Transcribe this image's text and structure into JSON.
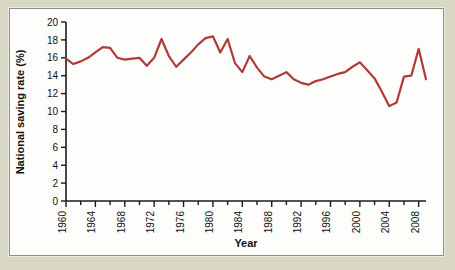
{
  "figure": {
    "background_color": "#d9d8c4",
    "card_color": "#fdfdfb",
    "border_color": "#8e8e86",
    "line_color": "#b03a3a",
    "axis_color": "#1a1a1a"
  },
  "chart_data": {
    "type": "line",
    "title": "",
    "xlabel": "Year",
    "ylabel": "National saving rate (%)",
    "xlim": [
      1960,
      2009
    ],
    "ylim": [
      0,
      20
    ],
    "grid": false,
    "legend": "none",
    "x_tick_labels": [
      "1960",
      "1964",
      "1968",
      "1972",
      "1976",
      "1980",
      "1984",
      "1988",
      "1992",
      "1996",
      "2000",
      "2004",
      "2008"
    ],
    "x_tick_step": 4,
    "x_minor_tick_step": 2,
    "y_tick_labels": [
      "0",
      "2",
      "4",
      "6",
      "8",
      "10",
      "12",
      "14",
      "16",
      "18",
      "20"
    ],
    "y_tick_step": 2,
    "series": [
      {
        "name": "National saving rate",
        "color": "#b03a3a",
        "x": [
          1960,
          1961,
          1962,
          1963,
          1964,
          1965,
          1966,
          1967,
          1968,
          1969,
          1970,
          1971,
          1972,
          1973,
          1974,
          1975,
          1976,
          1977,
          1978,
          1979,
          1980,
          1981,
          1982,
          1983,
          1984,
          1985,
          1986,
          1987,
          1988,
          1989,
          1990,
          1991,
          1992,
          1993,
          1994,
          1995,
          1996,
          1997,
          1998,
          1999,
          2000,
          2001,
          2002,
          2003,
          2004,
          2005,
          2006,
          2007,
          2008,
          2009
        ],
        "values": [
          15.9,
          15.3,
          15.6,
          16.0,
          16.6,
          17.2,
          17.1,
          16.0,
          15.8,
          15.9,
          16.0,
          15.1,
          16.0,
          18.1,
          16.2,
          15.0,
          15.8,
          16.6,
          17.5,
          18.2,
          18.4,
          16.6,
          18.1,
          15.4,
          14.4,
          16.2,
          14.9,
          13.9,
          13.6,
          14.0,
          14.4,
          13.6,
          13.2,
          13.0,
          13.4,
          13.6,
          13.9,
          14.2,
          14.4,
          15.0,
          15.5,
          14.6,
          13.7,
          12.2,
          10.6,
          11.0,
          13.9,
          14.0,
          17.0,
          13.6
        ]
      }
    ]
  }
}
